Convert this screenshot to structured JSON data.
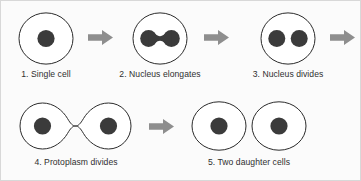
{
  "diagram": {
    "background_color": "#fbfbfb",
    "border_color": "#d8d8d8",
    "cell_outline_color": "#2b2b2b",
    "nucleus_color": "#3b3b3b",
    "arrow_color": "#8e8e8e",
    "caption_color": "#2f2f2f"
  },
  "stages": [
    {
      "number": "1",
      "caption": "1. Single cell",
      "shape": "circle-one-nucleus",
      "nuclei": 1
    },
    {
      "number": "2",
      "caption": "2. Nucleus elongates",
      "shape": "circle-dumbbell-nucleus",
      "nuclei": 1
    },
    {
      "number": "3",
      "caption": "3. Nucleus divides",
      "shape": "circle-two-nuclei",
      "nuclei": 2
    },
    {
      "number": "4",
      "caption": "4. Protoplasm divides",
      "shape": "dumbbell-cell-two-nuclei",
      "nuclei": 2
    },
    {
      "number": "5",
      "caption": "5. Two daughter cells",
      "shape": "two-circles-one-nucleus-each",
      "nuclei": 2
    }
  ],
  "arrows": [
    {
      "name": "arrow-stage-1-to-2",
      "direction": "right"
    },
    {
      "name": "arrow-stage-2-to-3",
      "direction": "right"
    },
    {
      "name": "arrow-stage-3-to-4",
      "direction": "right"
    },
    {
      "name": "arrow-stage-4-to-5",
      "direction": "right"
    }
  ]
}
